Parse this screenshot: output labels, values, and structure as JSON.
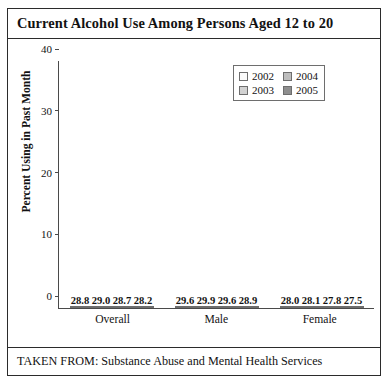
{
  "figure": {
    "title": "Current Alcohol Use Among Persons Aged 12 to 20",
    "caption": "TAKEN FROM: Substance Abuse and Mental Health Services"
  },
  "axes": {
    "ylabel": "Percent Using in Past Month",
    "yticks": [
      "0",
      "10",
      "20",
      "30",
      "40"
    ]
  },
  "legend": {
    "items": [
      {
        "label": "2002",
        "color": "#fbfbfb"
      },
      {
        "label": "2003",
        "color": "#d2d2d2"
      },
      {
        "label": "2004",
        "color": "#bdbdbd"
      },
      {
        "label": "2005",
        "color": "#8e8e8e"
      }
    ]
  },
  "categories": [
    "Overall",
    "Male",
    "Female"
  ],
  "bars": {
    "overall": [
      {
        "year": "2002",
        "value": "28.8"
      },
      {
        "year": "2003",
        "value": "29.0"
      },
      {
        "year": "2004",
        "value": "28.7"
      },
      {
        "year": "2005",
        "value": "28.2"
      }
    ],
    "male": [
      {
        "year": "2002",
        "value": "29.6"
      },
      {
        "year": "2003",
        "value": "29.9"
      },
      {
        "year": "2004",
        "value": "29.6"
      },
      {
        "year": "2005",
        "value": "28.9"
      }
    ],
    "female": [
      {
        "year": "2002",
        "value": "28.0"
      },
      {
        "year": "2003",
        "value": "28.1"
      },
      {
        "year": "2004",
        "value": "27.8"
      },
      {
        "year": "2005",
        "value": "27.5"
      }
    ]
  },
  "chart_data": {
    "type": "bar",
    "title": "Current Alcohol Use Among Persons Aged 12 to 20",
    "subtitle": "",
    "xlabel": "",
    "ylabel": "Percent Using in Past Month",
    "categories": [
      "Overall",
      "Male",
      "Female"
    ],
    "series": [
      {
        "name": "2002",
        "values": [
          28.8,
          29.6,
          28.0
        ],
        "color": "#fbfbfb"
      },
      {
        "name": "2003",
        "values": [
          29.0,
          29.9,
          28.1
        ],
        "color": "#d2d2d2"
      },
      {
        "name": "2004",
        "values": [
          28.7,
          29.6,
          27.8
        ],
        "color": "#bdbdbd"
      },
      {
        "name": "2005",
        "values": [
          28.2,
          28.9,
          27.5
        ],
        "color": "#8e8e8e"
      }
    ],
    "ylim": [
      0,
      40
    ],
    "yticks": [
      0,
      10,
      20,
      30,
      40
    ],
    "grid": false,
    "legend_position": "top-right",
    "data_labels": true,
    "annotations": [
      "TAKEN FROM: Substance Abuse and Mental Health Services"
    ]
  }
}
